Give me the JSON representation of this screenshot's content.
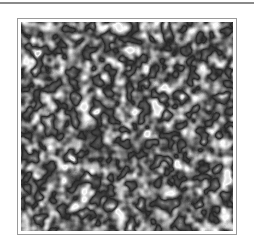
{
  "figure": {
    "description": "Grayscale noise texture with bright contour-like rims around dark and light blobs",
    "colors": {
      "rule": "#8a8a8a",
      "frame_border": "#9a9a9a",
      "background": "#ffffff",
      "texture_dark": "#111111",
      "texture_light": "#ffffff"
    },
    "texture": {
      "type": "turbulence",
      "base_frequency": 0.09,
      "octaves": 2,
      "seed": 7
    }
  }
}
